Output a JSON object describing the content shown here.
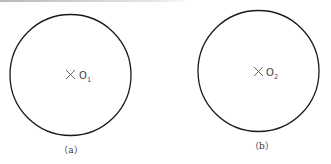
{
  "figure": {
    "panels": [
      {
        "id": "a",
        "caption": "（a）",
        "center_label": "O",
        "center_subscript": "1",
        "circle": {
          "cx": 70.5,
          "cy": 75,
          "r": 60.5
        }
      },
      {
        "id": "b",
        "caption": "（b）",
        "center_label": "O",
        "center_subscript": "2",
        "circle": {
          "cx": 258.5,
          "cy": 71,
          "r": 60.5
        }
      }
    ],
    "colors": {
      "stroke": "#1a1a1a",
      "text": "#333333",
      "background": "#ffffff"
    }
  }
}
